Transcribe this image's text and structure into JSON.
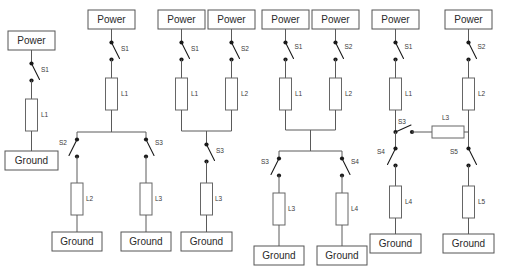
{
  "diagram": {
    "type": "circuit-schematic-set",
    "background_color": "#ffffff",
    "wire_color": "#5a5a5a",
    "node_color": "#1a1a1a",
    "box_fill": "#ffffff",
    "box_stroke": "#555555",
    "power_label": "Power",
    "ground_label": "Ground",
    "circuits": [
      {
        "id": "circuit-1",
        "sources": [
          "Power"
        ],
        "switches": [
          "S1"
        ],
        "resistors": [
          "L1"
        ],
        "sinks": [
          "Ground"
        ],
        "topology": "series"
      },
      {
        "id": "circuit-2",
        "sources": [
          "Power"
        ],
        "switches": [
          "S1",
          "S2",
          "S3"
        ],
        "resistors": [
          "L1",
          "L2",
          "L3"
        ],
        "sinks": [
          "Ground",
          "Ground"
        ],
        "topology": "one-source-split-two-branches"
      },
      {
        "id": "circuit-3",
        "sources": [
          "Power",
          "Power"
        ],
        "switches": [
          "S1",
          "S2",
          "S3"
        ],
        "resistors": [
          "L1",
          "L2",
          "L3"
        ],
        "sinks": [
          "Ground"
        ],
        "topology": "two-sources-merge-one-sink"
      },
      {
        "id": "circuit-4",
        "sources": [
          "Power",
          "Power"
        ],
        "switches": [
          "S1",
          "S2",
          "S3",
          "S4"
        ],
        "resistors": [
          "L1",
          "L2",
          "L3",
          "L4"
        ],
        "sinks": [
          "Ground",
          "Ground"
        ],
        "topology": "two-sources-merge-split-two-sinks"
      },
      {
        "id": "circuit-5",
        "sources": [
          "Power",
          "Power"
        ],
        "switches": [
          "S1",
          "S2",
          "S3",
          "S4",
          "S5"
        ],
        "resistors": [
          "L1",
          "L2",
          "L3",
          "L4",
          "L5"
        ],
        "sinks": [
          "Ground",
          "Ground"
        ],
        "topology": "two-parallel-legs-with-cross-link"
      }
    ],
    "labels": {
      "c1_power": "Power",
      "c1_s1": "S1",
      "c1_l1": "L1",
      "c1_ground": "Ground",
      "c2_power": "Power",
      "c2_s1": "S1",
      "c2_l1": "L1",
      "c2_s2": "S2",
      "c2_s3": "S3",
      "c2_l2": "L2",
      "c2_l3": "L3",
      "c2_ground_left": "Ground",
      "c2_ground_right": "Ground",
      "c3_power_left": "Power",
      "c3_power_right": "Power",
      "c3_s1": "S1",
      "c3_s2": "S2",
      "c3_l1": "L1",
      "c3_l2": "L2",
      "c3_s3": "S3",
      "c3_l3": "L3",
      "c3_ground": "Ground",
      "c4_power_left": "Power",
      "c4_power_right": "Power",
      "c4_s1": "S1",
      "c4_s2": "S2",
      "c4_l1": "L1",
      "c4_l2": "L2",
      "c4_s3": "S3",
      "c4_s4": "S4",
      "c4_l3": "L3",
      "c4_l4": "L4",
      "c4_ground_left": "Ground",
      "c4_ground_right": "Ground",
      "c5_power_left": "Power",
      "c5_power_right": "Power",
      "c5_s1": "S1",
      "c5_s2": "S2",
      "c5_l1": "L1",
      "c5_l2": "L2",
      "c5_s3": "S3",
      "c5_l3": "L3",
      "c5_s4": "S4",
      "c5_s5": "S5",
      "c5_l4": "L4",
      "c5_l5": "L5",
      "c5_ground_left": "Ground",
      "c5_ground_right": "Ground"
    }
  }
}
